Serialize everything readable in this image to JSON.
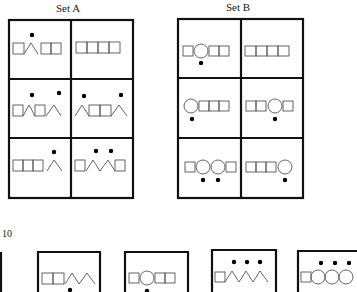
{
  "set_a": {
    "title": "Set A"
  },
  "set_b": {
    "title": "Set B"
  },
  "problem": {
    "number": "10"
  },
  "cells": {
    "set_a": [
      {
        "shapes": [
          "square",
          "triangle",
          "square",
          "square"
        ],
        "dots": "above triangle"
      },
      {
        "shapes": [
          "square",
          "square",
          "square",
          "square"
        ],
        "dots": "none"
      },
      {
        "shapes": [
          "square",
          "triangle",
          "square",
          "triangle"
        ],
        "dots": "above each triangle"
      },
      {
        "shapes": [
          "triangle",
          "square",
          "square",
          "triangle"
        ],
        "dots": "above each triangle"
      },
      {
        "shapes": [
          "square",
          "square",
          "square",
          "triangle"
        ],
        "dots": "above triangle"
      },
      {
        "shapes": [
          "square",
          "triangle",
          "triangle",
          "square"
        ],
        "dots": "above each triangle"
      }
    ],
    "set_b": [
      {
        "shapes": [
          "square",
          "circle",
          "square",
          "square"
        ],
        "dots": "below circle"
      },
      {
        "shapes": [
          "square",
          "square",
          "square",
          "square"
        ],
        "dots": "none"
      },
      {
        "shapes": [
          "circle",
          "square",
          "square",
          "square"
        ],
        "dots": "below circle"
      },
      {
        "shapes": [
          "square",
          "square",
          "circle",
          "square"
        ],
        "dots": "below circle"
      },
      {
        "shapes": [
          "square",
          "circle",
          "circle",
          "square"
        ],
        "dots": "below each circle"
      },
      {
        "shapes": [
          "square",
          "square",
          "square",
          "circle"
        ],
        "dots": "below circle"
      }
    ],
    "test": [
      {
        "shapes": [
          "square",
          "square",
          "triangle",
          "triangle"
        ],
        "dots": "below"
      },
      {
        "shapes": [
          "square",
          "circle",
          "square",
          "square"
        ],
        "dots": "below circle"
      },
      {
        "shapes": [
          "square",
          "triangle",
          "triangle",
          "triangle"
        ],
        "dots": "above each triangle"
      },
      {
        "shapes": [
          "square",
          "circle",
          "circle",
          "circle"
        ],
        "dots": "above each circle"
      }
    ]
  }
}
